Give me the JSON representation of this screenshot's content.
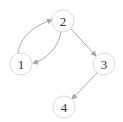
{
  "graph": {
    "nodes": [
      {
        "id": "1",
        "label": "1",
        "x": 21,
        "y": 64,
        "r": 11
      },
      {
        "id": "2",
        "label": "2",
        "x": 63,
        "y": 21,
        "r": 11
      },
      {
        "id": "3",
        "label": "3",
        "x": 104,
        "y": 64,
        "r": 11
      },
      {
        "id": "4",
        "label": "4",
        "x": 64,
        "y": 107,
        "r": 11
      }
    ],
    "edges": [
      {
        "from": "1",
        "to": "2",
        "curved": true
      },
      {
        "from": "2",
        "to": "1",
        "curved": true
      },
      {
        "from": "2",
        "to": "3",
        "curved": false
      },
      {
        "from": "3",
        "to": "4",
        "curved": false
      }
    ],
    "colors": {
      "edge": "#a8a8a8",
      "node_stroke": "#d9d9d9",
      "label": "#333333",
      "background": "#ffffff"
    }
  }
}
